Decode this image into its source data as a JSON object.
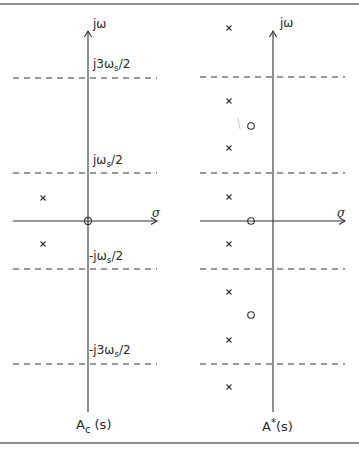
{
  "figure": {
    "rules": {
      "top_y": 4,
      "bottom_y": 443,
      "color": "#6a6a6a"
    },
    "left_plot": {
      "caption_main": "A",
      "caption_sub": "c",
      "caption_tail": " (s)",
      "axis_labels": {
        "imag": "jω",
        "real": "σ"
      },
      "line_labels": [
        {
          "pre": "j3ω",
          "sub": "s",
          "post": "/2"
        },
        {
          "pre": "jω",
          "sub": "s",
          "post": "/2"
        },
        {
          "pre": "-jω",
          "sub": "s",
          "post": "/2"
        },
        {
          "pre": "-j3ω",
          "sub": "s",
          "post": "/2"
        }
      ],
      "poles": [
        {
          "x": 43,
          "y": 198
        },
        {
          "x": 43,
          "y": 244
        }
      ],
      "zeros": [
        {
          "x": 88,
          "y": 221
        }
      ]
    },
    "right_plot": {
      "caption_main": "A",
      "caption_sup": "*",
      "caption_tail": "(s)",
      "axis_labels": {
        "imag": "jω",
        "real": "σ"
      },
      "poles": [
        {
          "x": 229,
          "y": 28
        },
        {
          "x": 229,
          "y": 101
        },
        {
          "x": 229,
          "y": 148
        },
        {
          "x": 229,
          "y": 197
        },
        {
          "x": 229,
          "y": 244
        },
        {
          "x": 229,
          "y": 292
        },
        {
          "x": 229,
          "y": 340
        },
        {
          "x": 229,
          "y": 387
        }
      ],
      "zeros": [
        {
          "x": 251,
          "y": 126
        },
        {
          "x": 251,
          "y": 221
        },
        {
          "x": 251,
          "y": 315
        }
      ]
    },
    "markers": {
      "pole_symbol": "×",
      "zero_symbol": "○"
    }
  }
}
